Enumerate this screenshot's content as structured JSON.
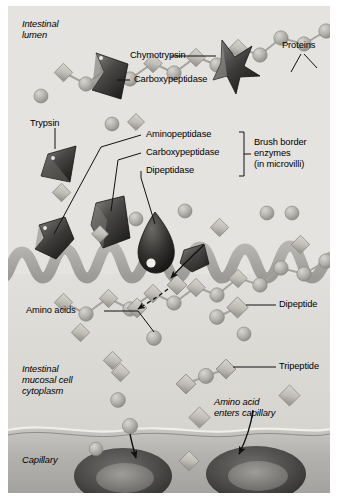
{
  "figure": {
    "type": "biology-diagram"
  },
  "regions": [
    {
      "id": "intestinal-lumen",
      "label": "Intestinal\nlumen",
      "style": "italic"
    },
    {
      "id": "mucosal-cytoplasm",
      "label": "Intestinal\nmucosal cell\ncytoplasm",
      "style": "italic"
    },
    {
      "id": "capillary",
      "label": "Capillary",
      "style": "italic"
    }
  ],
  "labels": {
    "chymotrypsin": "Chymotrypsin",
    "carboxypeptidase_lumen": "Carboxypeptidase",
    "proteins": "Proteins",
    "trypsin": "Trypsin",
    "aminopeptidase": "Aminopeptidase",
    "carboxypeptidase_brush": "Carboxypeptidase",
    "dipeptidase": "Dipeptidase",
    "amino_acids": "Amino acids",
    "dipeptide": "Dipeptide",
    "tripeptide": "Tripeptide",
    "amino_acid_enters": "Amino acid\nenters capillary"
  },
  "bracket_group": {
    "line1": "Brush border",
    "line2": "enzymes",
    "line3": "(in microvilli)",
    "members": [
      "Aminopeptidase",
      "Carboxypeptidase",
      "Dipeptidase"
    ]
  },
  "colors": {
    "background": "#e2e1dd",
    "lumen": "#e4e3df",
    "cytoplasm": "#dedcd7",
    "capillary": "#b9b8b4",
    "microvilli": "#a9a8a4",
    "enzyme_dark": "#3a3a3a",
    "bead": "#b0aea8",
    "diamond": "#c9c7c1",
    "rbc": "#555453",
    "leader_line": "#1a1a1a"
  }
}
